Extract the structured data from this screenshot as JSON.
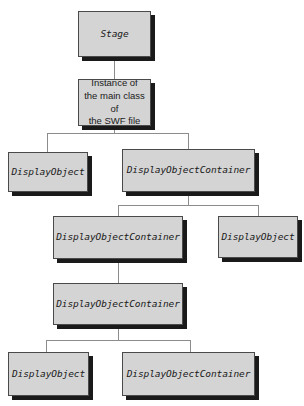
{
  "diagram": {
    "colors": {
      "box_fill": "#d4d4d4",
      "box_border": "#4a4a4a",
      "box_shadow": "#1a1a1a",
      "connector": "#8c8c8c",
      "background": "#ffffff",
      "text": "#1a1a1a"
    },
    "nodes": [
      {
        "id": "stage",
        "label": "Stage",
        "style": "mono",
        "x": 78,
        "y": 11,
        "w": 73,
        "h": 46
      },
      {
        "id": "main",
        "label": "Instance of\nthe main class of\nthe SWF file",
        "style": "prose",
        "x": 78,
        "y": 79,
        "w": 73,
        "h": 47
      },
      {
        "id": "do1",
        "label": "DisplayObject",
        "style": "mono",
        "x": 8,
        "y": 152,
        "w": 80,
        "h": 40
      },
      {
        "id": "doc1",
        "label": "DisplayObjectContainer",
        "style": "mono",
        "x": 122,
        "y": 149,
        "w": 133,
        "h": 43
      },
      {
        "id": "doc2",
        "label": "DisplayObjectContainer",
        "style": "mono",
        "x": 53,
        "y": 216,
        "w": 130,
        "h": 43
      },
      {
        "id": "do2",
        "label": "DisplayObject",
        "style": "mono",
        "x": 218,
        "y": 216,
        "w": 80,
        "h": 42
      },
      {
        "id": "doc3",
        "label": "DisplayObjectContainer",
        "style": "mono",
        "x": 53,
        "y": 283,
        "w": 130,
        "h": 42
      },
      {
        "id": "do3",
        "label": "DisplayObject",
        "style": "mono",
        "x": 8,
        "y": 352,
        "w": 81,
        "h": 44
      },
      {
        "id": "doc4",
        "label": "DisplayObjectContainer",
        "style": "mono",
        "x": 122,
        "y": 352,
        "w": 133,
        "h": 44
      }
    ],
    "connectors": [
      {
        "id": "stage-to-main",
        "type": "v",
        "x": 114,
        "y": 57,
        "len": 22
      },
      {
        "id": "main-stem",
        "type": "v",
        "x": 114,
        "y": 126,
        "len": 8
      },
      {
        "id": "main-bus",
        "type": "h",
        "x": 47,
        "y": 133,
        "len": 141
      },
      {
        "id": "main-drop-left",
        "type": "v",
        "x": 47,
        "y": 133,
        "len": 19
      },
      {
        "id": "main-drop-right",
        "type": "v",
        "x": 188,
        "y": 133,
        "len": 16
      },
      {
        "id": "doc1-stem",
        "type": "v",
        "x": 188,
        "y": 192,
        "len": 13
      },
      {
        "id": "doc1-bus",
        "type": "h",
        "x": 118,
        "y": 205,
        "len": 140
      },
      {
        "id": "doc1-drop-left",
        "type": "v",
        "x": 118,
        "y": 205,
        "len": 11
      },
      {
        "id": "doc1-drop-right",
        "type": "v",
        "x": 258,
        "y": 205,
        "len": 11
      },
      {
        "id": "doc2-to-doc3",
        "type": "v",
        "x": 118,
        "y": 259,
        "len": 24
      },
      {
        "id": "doc3-stem",
        "type": "v",
        "x": 118,
        "y": 325,
        "len": 15
      },
      {
        "id": "doc3-bus",
        "type": "h",
        "x": 46,
        "y": 340,
        "len": 144
      },
      {
        "id": "doc3-drop-left",
        "type": "v",
        "x": 46,
        "y": 340,
        "len": 12
      },
      {
        "id": "doc3-drop-right",
        "type": "v",
        "x": 190,
        "y": 340,
        "len": 12
      }
    ]
  }
}
